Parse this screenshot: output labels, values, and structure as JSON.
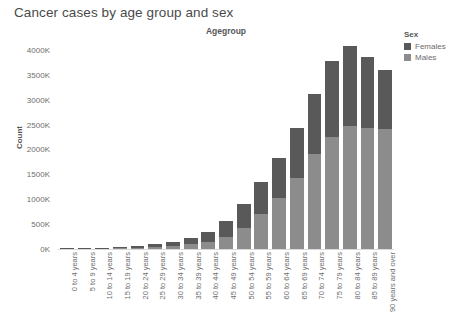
{
  "title": "Cancer cases by age group and sex",
  "agegroup_header": "Agegroup",
  "legend": {
    "title": "Sex",
    "items": [
      {
        "label": "Females",
        "color": "#595959"
      },
      {
        "label": "Males",
        "color": "#8c8c8c"
      }
    ]
  },
  "y_axis": {
    "label": "Count",
    "ticks": [
      "0K",
      "500K",
      "1000K",
      "1500K",
      "2000K",
      "2500K",
      "3000K",
      "3500K",
      "4000K"
    ]
  },
  "chart_data": {
    "type": "bar",
    "title": "Cancer cases by age group and sex",
    "xlabel": "Agegroup",
    "ylabel": "Count",
    "stacked": true,
    "grid": false,
    "legend_position": "right",
    "ylim": [
      0,
      4200
    ],
    "ytick_values": [
      0,
      500,
      1000,
      1500,
      2000,
      2500,
      3000,
      3500,
      4000
    ],
    "units": "thousands of cases (K)",
    "categories": [
      "0 to 4 years",
      "5 to 9 years",
      "10 to 14 years",
      "15 to 19 years",
      "20 to 24 years",
      "25 to 29 years",
      "30 to 34 years",
      "35 to 39 years",
      "40 to 44 years",
      "45 to 49 years",
      "50 to 54 years",
      "55 to 59 years",
      "60 to 64 years",
      "65 to 69 years",
      "70 to 74 years",
      "75 to 79 years",
      "80 to 84 years",
      "85 to 89 years",
      "90 years and over"
    ],
    "series": [
      {
        "name": "Males",
        "color": "#8c8c8c",
        "values": [
          10,
          8,
          10,
          18,
          28,
          42,
          62,
          95,
          150,
          250,
          430,
          700,
          1020,
          1420,
          1900,
          2250,
          2480,
          2430,
          2420
        ]
      },
      {
        "name": "Females",
        "color": "#595959",
        "values": [
          8,
          7,
          9,
          17,
          34,
          58,
          88,
          135,
          200,
          320,
          470,
          640,
          800,
          1010,
          1210,
          1530,
          1600,
          1430,
          1180
        ]
      }
    ],
    "totals": [
      18,
      15,
      19,
      35,
      62,
      100,
      150,
      230,
      350,
      570,
      900,
      1340,
      1820,
      2430,
      3110,
      3780,
      4080,
      3860,
      3600
    ]
  }
}
